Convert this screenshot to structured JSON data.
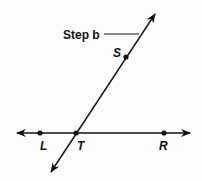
{
  "diagram": {
    "annotation": {
      "text": "Step b"
    },
    "points": [
      {
        "id": "S",
        "label": "S"
      },
      {
        "id": "L",
        "label": "L"
      },
      {
        "id": "T",
        "label": "T"
      },
      {
        "id": "R",
        "label": "R"
      }
    ],
    "lines": [
      {
        "name": "line-LR",
        "through": [
          "L",
          "T",
          "R"
        ],
        "arrows": "both"
      },
      {
        "name": "line-TS",
        "through": [
          "T",
          "S"
        ],
        "arrows": "both"
      }
    ],
    "colors": {
      "stroke": "#111111",
      "background": "#fdfdfd"
    }
  }
}
